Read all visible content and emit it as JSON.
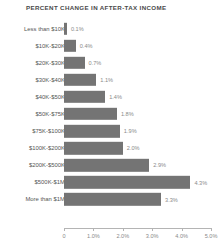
{
  "chart_data": {
    "type": "bar",
    "orientation": "horizontal",
    "title": "PERCENT CHANGE IN AFTER-TAX INCOME",
    "xlabel": "",
    "ylabel": "",
    "xlim": [
      0,
      5.0
    ],
    "grid": false,
    "legend": null,
    "bar_color": "#747474",
    "categories": [
      "Less than $10K",
      "$10K-$20K",
      "$20K-$30K",
      "$30K-$40K",
      "$40K-$50K",
      "$50K-$75K",
      "$75K-$100K",
      "$100K-$200K",
      "$200K-$500K",
      "$500K-$1M",
      "More than $1M"
    ],
    "values": [
      0.1,
      0.4,
      0.7,
      1.1,
      1.4,
      1.8,
      1.9,
      2.0,
      2.9,
      4.3,
      3.3
    ],
    "value_labels": [
      "0.1%",
      "0.4%",
      "0.7%",
      "1.1%",
      "1.4%",
      "1.8%",
      "1.9%",
      "2.0%",
      "2.9%",
      "4.3%",
      "3.3%"
    ],
    "xticks": [
      0,
      1.0,
      2.0,
      3.0,
      4.0,
      5.0
    ],
    "xtick_labels": [
      "0",
      "1.0%",
      "2.0%",
      "3.0%",
      "4.0%",
      "5.0%"
    ]
  }
}
